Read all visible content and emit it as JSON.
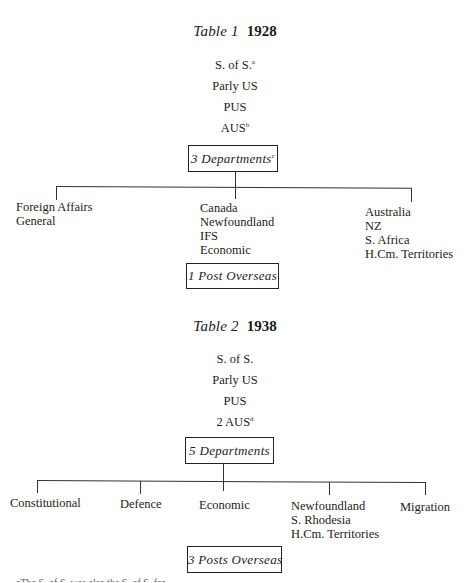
{
  "table1": {
    "label": "Table 1",
    "year": "1928",
    "officials": [
      {
        "text": "S. of S.",
        "note": "a"
      },
      {
        "text": "Parly US",
        "note": ""
      },
      {
        "text": "PUS",
        "note": ""
      },
      {
        "text": "AUS",
        "note": "b"
      }
    ],
    "departments_box": {
      "text": "3 Departments",
      "note": "c"
    },
    "departments": [
      {
        "lines": [
          "Foreign Affairs",
          "General"
        ]
      },
      {
        "lines": [
          "Canada",
          "Newfoundland",
          "IFS",
          "Economic"
        ]
      },
      {
        "lines": [
          "Australia",
          "NZ",
          "S. Africa",
          "H.Cm. Territories"
        ]
      }
    ],
    "posts_box": "1 Post Overseas"
  },
  "table2": {
    "label": "Table 2",
    "year": "1938",
    "officials": [
      {
        "text": "S. of S.",
        "note": ""
      },
      {
        "text": "Parly US",
        "note": ""
      },
      {
        "text": "PUS",
        "note": ""
      },
      {
        "text": "2 AUS",
        "note": "d"
      }
    ],
    "departments_box": {
      "text": "5 Departments",
      "note": ""
    },
    "departments": [
      {
        "lines": [
          "Constitutional"
        ]
      },
      {
        "lines": [
          "Defence"
        ]
      },
      {
        "lines": [
          "Economic"
        ]
      },
      {
        "lines": [
          "Newfoundland",
          "S. Rhodesia",
          "H.Cm. Territories"
        ]
      },
      {
        "lines": [
          "Migration"
        ]
      }
    ],
    "posts_box": "3 Posts Overseas"
  },
  "footnote": "aThe S. of S. was also the S. of S. for..."
}
